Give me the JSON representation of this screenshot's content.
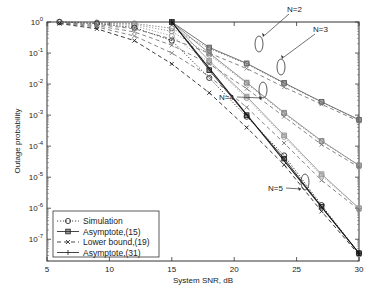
{
  "chart_data": {
    "type": "line",
    "title": "",
    "xlabel": "System SNR, dB",
    "ylabel": "Outage probability",
    "xlim": [
      5,
      30
    ],
    "ylim_log10": [
      -7.7,
      0
    ],
    "yscale": "log",
    "grid": false,
    "x_ticks": [
      "5",
      "10",
      "15",
      "20",
      "25",
      "30"
    ],
    "y_ticks": [
      {
        "base": "10",
        "exp": "0",
        "log": 0
      },
      {
        "base": "10",
        "exp": "-1",
        "log": -1
      },
      {
        "base": "10",
        "exp": "-2",
        "log": -2
      },
      {
        "base": "10",
        "exp": "-3",
        "log": -3
      },
      {
        "base": "10",
        "exp": "-4",
        "log": -4
      },
      {
        "base": "10",
        "exp": "-5",
        "log": -5
      },
      {
        "base": "10",
        "exp": "-6",
        "log": -6
      },
      {
        "base": "10",
        "exp": "-7",
        "log": -7
      }
    ],
    "x": [
      6,
      9,
      12,
      15,
      18,
      21,
      24,
      27,
      30
    ],
    "legend": {
      "position": "lower left",
      "entries": [
        {
          "label": "Simulation",
          "style": "dotted",
          "marker": "circle"
        },
        {
          "label": "Asymptote,(15)",
          "style": "solid",
          "marker": "square"
        },
        {
          "label": "Lower bound,(19)",
          "style": "dashed",
          "marker": "x"
        },
        {
          "label": "Asymptote,(31)",
          "style": "solid",
          "marker": "plus"
        }
      ]
    },
    "series": [
      {
        "name": "Simulation N=2",
        "N": 2,
        "kind": "simulation",
        "log10_values": [
          0,
          -0.02,
          -0.05,
          -0.2,
          -0.85,
          -1.35,
          -1.98,
          -2.58,
          -3.15
        ]
      },
      {
        "name": "Simulation N=3",
        "N": 3,
        "kind": "simulation",
        "log10_values": [
          0,
          -0.03,
          -0.08,
          -0.3,
          -1.05,
          -1.98,
          -2.95,
          -3.85,
          -4.62
        ]
      },
      {
        "name": "Simulation N=4",
        "N": 4,
        "kind": "simulation",
        "log10_values": [
          0,
          -0.04,
          -0.12,
          -0.45,
          -1.3,
          -2.45,
          -3.7,
          -4.95,
          -6.0
        ]
      },
      {
        "name": "Simulation N=5",
        "N": 5,
        "kind": "simulation",
        "log10_values": [
          0,
          -0.05,
          -0.18,
          -0.6,
          -1.8,
          -3.05,
          -4.3,
          -5.9,
          -7.45
        ]
      },
      {
        "name": "Asymptote(15) N=2",
        "N": 2,
        "kind": "asym15",
        "x": [
          15,
          18,
          21,
          24,
          27,
          30
        ],
        "log10_values": [
          0,
          -0.82,
          -1.33,
          -1.96,
          -2.57,
          -3.15
        ]
      },
      {
        "name": "Asymptote(15) N=3",
        "N": 3,
        "kind": "asym15",
        "x": [
          15,
          18,
          21,
          24,
          27,
          30
        ],
        "log10_values": [
          0,
          -1.0,
          -1.95,
          -2.92,
          -3.83,
          -4.62
        ]
      },
      {
        "name": "Asymptote(15) N=4",
        "N": 4,
        "kind": "asym15",
        "x": [
          15,
          18,
          21,
          24,
          27,
          30
        ],
        "log10_values": [
          0,
          -1.25,
          -2.4,
          -3.65,
          -4.9,
          -6.0
        ]
      },
      {
        "name": "Asymptote(15) N=5",
        "N": 5,
        "kind": "asym15",
        "x": [
          15,
          18,
          21,
          24,
          27,
          30
        ],
        "log10_values": [
          0,
          -1.55,
          -3.0,
          -4.4,
          -5.95,
          -7.45
        ]
      },
      {
        "name": "Lower bound N=2",
        "N": 2,
        "kind": "lower",
        "log10_values": [
          -0.02,
          -0.08,
          -0.22,
          -0.55,
          -1.0,
          -1.5,
          -2.1,
          -2.65,
          -3.2
        ]
      },
      {
        "name": "Lower bound N=3",
        "N": 3,
        "kind": "lower",
        "log10_values": [
          -0.03,
          -0.12,
          -0.32,
          -0.75,
          -1.35,
          -2.15,
          -3.05,
          -3.95,
          -4.68
        ]
      },
      {
        "name": "Lower bound N=4",
        "N": 4,
        "kind": "lower",
        "log10_values": [
          -0.04,
          -0.16,
          -0.45,
          -1.0,
          -1.75,
          -2.75,
          -3.9,
          -5.1,
          -6.05
        ]
      },
      {
        "name": "Lower bound N=5",
        "N": 5,
        "kind": "lower",
        "log10_values": [
          -0.05,
          -0.22,
          -0.6,
          -1.35,
          -2.28,
          -3.4,
          -4.6,
          -6.1,
          -7.5
        ]
      },
      {
        "name": "Asymptote(31) N=5",
        "N": 5,
        "kind": "asym31",
        "x": [
          15,
          30
        ],
        "log10_values": [
          0,
          -7.45
        ]
      }
    ],
    "annotations": [
      {
        "text": "N=2",
        "target_x": 22.5,
        "target_log": -1.65
      },
      {
        "text": "N=3",
        "target_x": 23.8,
        "target_log": -2.65
      },
      {
        "text": "N=4",
        "target_x": 22.5,
        "target_log": -3.0
      },
      {
        "text": "N=5",
        "target_x": 24.8,
        "target_log": -5.0
      }
    ]
  }
}
